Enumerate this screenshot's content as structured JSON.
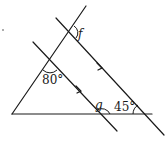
{
  "diagram": {
    "type": "geometry-parallel-lines",
    "labels": {
      "angle_top_left": "80°",
      "angle_base_right": "45°",
      "unknown_f": "f",
      "unknown_g": "g"
    },
    "marker": "·",
    "stroke_color": "#1a1a1a",
    "background": "#ffffff"
  }
}
